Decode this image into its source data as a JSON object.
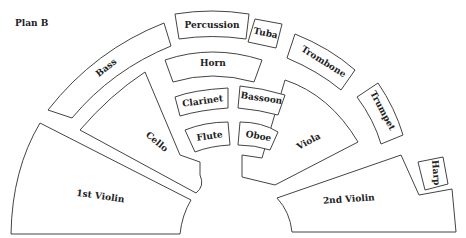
{
  "title": "Plan B",
  "sections": {
    "percussion": "Percussion",
    "tuba": "Tuba",
    "bass": "Bass",
    "trombone": "Trombone",
    "horn": "Horn",
    "trumpet": "Trumpet",
    "clarinet": "Clarinet",
    "bassoon": "Bassoon",
    "cello": "Cello",
    "flute": "Flute",
    "oboe": "Oboe",
    "viola": "Viola",
    "harp": "Harp",
    "first_violin": "1st Violin",
    "second_violin": "2nd Violin"
  }
}
